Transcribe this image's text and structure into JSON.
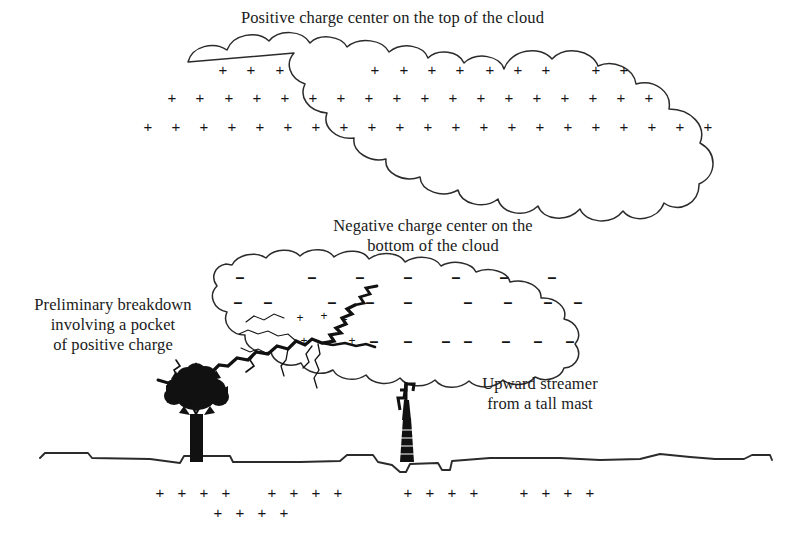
{
  "figure": {
    "background_color": "#ffffff",
    "ink_color": "#1a1a1a",
    "width": 785,
    "height": 539
  },
  "labels": {
    "top_caption": "Positive charge center on the top of the cloud",
    "negative_caption": "Negative charge center on the\nbottom of the cloud",
    "preliminary_caption": "Preliminary breakdown\ninvolving a pocket\nof positive charge",
    "upward_caption": "Upward streamer\nfrom a tall mast"
  },
  "symbols": {
    "plus": "+",
    "minus": "–"
  },
  "cloud_positive_charges": {
    "row1_y": 69,
    "row1_x": [
      223,
      251,
      280,
      375,
      404,
      432,
      460,
      490,
      518,
      546,
      596,
      624
    ],
    "row2_y": 97,
    "row2_x": [
      172,
      200,
      229,
      257,
      285,
      313,
      341,
      369,
      397,
      425,
      453,
      481,
      509,
      537,
      565,
      593,
      621,
      649
    ],
    "row3_y": 126,
    "row3_x": [
      148,
      176,
      204,
      232,
      260,
      288,
      316,
      344,
      372,
      400,
      428,
      456,
      484,
      512,
      540,
      568,
      596,
      624,
      652,
      680,
      708
    ]
  },
  "cloud_negative_charges": {
    "row1_y": 277,
    "row1_x": [
      240,
      312,
      360,
      408,
      456,
      504,
      552
    ],
    "row2_y": 302,
    "row2_x": [
      238,
      268,
      332,
      370,
      408,
      468,
      508,
      548,
      578
    ],
    "row3_y": 341,
    "row3_x": [
      374,
      408,
      446,
      468,
      506,
      538,
      570
    ]
  },
  "pocket_positive_charges": {
    "items": [
      {
        "x": 300,
        "y": 318
      },
      {
        "x": 324,
        "y": 316
      },
      {
        "x": 344,
        "y": 320
      },
      {
        "x": 304,
        "y": 341
      },
      {
        "x": 330,
        "y": 343
      },
      {
        "x": 352,
        "y": 341
      }
    ]
  },
  "ground_positive_charges": {
    "row1_y": 492,
    "row1_x": [
      160,
      182,
      204,
      226,
      272,
      294,
      316,
      338,
      408,
      430,
      452,
      474,
      524,
      546,
      568,
      590
    ],
    "row2_y": 512,
    "row2_x": [
      218,
      240,
      262,
      284
    ]
  }
}
